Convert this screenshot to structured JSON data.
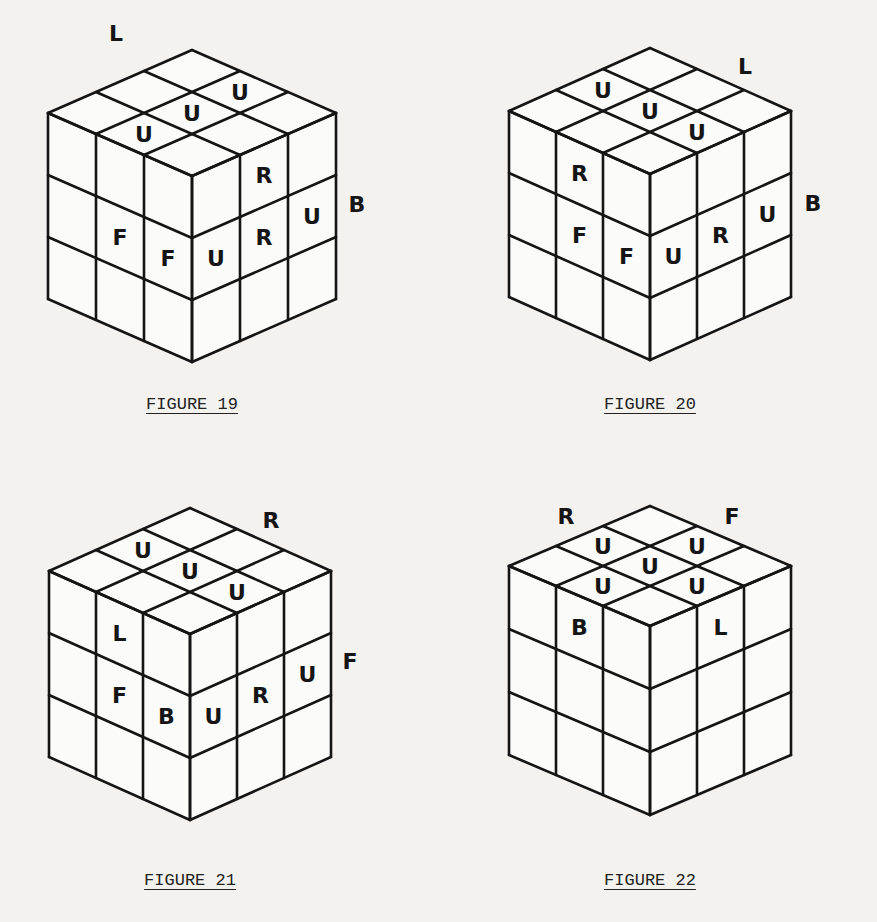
{
  "colors": {
    "background": "#f3f2ef",
    "line": "#151515",
    "face": "#fbfbf9"
  },
  "figures": [
    {
      "caption": "FIGURE 19",
      "origin": [
        0,
        0
      ],
      "cube": {
        "cx": 192,
        "top": 50,
        "dx": 48,
        "dy": 21,
        "h": 62,
        "caption_y": 395
      },
      "face_labels": [
        {
          "text": "L",
          "x": 116,
          "y": 33
        },
        {
          "text": "B",
          "x": 357,
          "y": 204
        }
      ],
      "stickers": [
        {
          "face": "top",
          "row": 0,
          "col": 1,
          "text": "U"
        },
        {
          "face": "top",
          "row": 1,
          "col": 1,
          "text": "U"
        },
        {
          "face": "top",
          "row": 2,
          "col": 1,
          "text": "U"
        },
        {
          "face": "left",
          "row": 1,
          "col": 1,
          "text": "F"
        },
        {
          "face": "left",
          "row": 1,
          "col": 2,
          "text": "F"
        },
        {
          "face": "right",
          "row": 0,
          "col": 1,
          "text": "R"
        },
        {
          "face": "right",
          "row": 1,
          "col": 0,
          "text": "U"
        },
        {
          "face": "right",
          "row": 1,
          "col": 1,
          "text": "R"
        },
        {
          "face": "right",
          "row": 1,
          "col": 2,
          "text": "U"
        }
      ]
    },
    {
      "caption": "FIGURE 20",
      "origin": [
        480,
        0
      ],
      "cube": {
        "cx": 170,
        "top": 48,
        "dx": 47,
        "dy": 21,
        "h": 62,
        "caption_y": 395
      },
      "face_labels": [
        {
          "text": "L",
          "x": 265,
          "y": 66
        },
        {
          "text": "B",
          "x": 333,
          "y": 203
        }
      ],
      "stickers": [
        {
          "face": "top",
          "row": 1,
          "col": 0,
          "text": "U"
        },
        {
          "face": "top",
          "row": 1,
          "col": 1,
          "text": "U"
        },
        {
          "face": "top",
          "row": 1,
          "col": 2,
          "text": "U"
        },
        {
          "face": "left",
          "row": 0,
          "col": 1,
          "text": "R"
        },
        {
          "face": "left",
          "row": 1,
          "col": 1,
          "text": "F"
        },
        {
          "face": "left",
          "row": 1,
          "col": 2,
          "text": "F"
        },
        {
          "face": "right",
          "row": 1,
          "col": 0,
          "text": "U"
        },
        {
          "face": "right",
          "row": 1,
          "col": 1,
          "text": "R"
        },
        {
          "face": "right",
          "row": 1,
          "col": 2,
          "text": "U"
        }
      ]
    },
    {
      "caption": "FIGURE 21",
      "origin": [
        0,
        460
      ],
      "cube": {
        "cx": 190,
        "top": 48,
        "dx": 47,
        "dy": 21,
        "h": 62,
        "caption_y": 411
      },
      "face_labels": [
        {
          "text": "R",
          "x": 271,
          "y": 60
        },
        {
          "text": "F",
          "x": 350,
          "y": 201
        }
      ],
      "stickers": [
        {
          "face": "top",
          "row": 1,
          "col": 0,
          "text": "U"
        },
        {
          "face": "top",
          "row": 1,
          "col": 1,
          "text": "U"
        },
        {
          "face": "top",
          "row": 1,
          "col": 2,
          "text": "U"
        },
        {
          "face": "left",
          "row": 0,
          "col": 1,
          "text": "L"
        },
        {
          "face": "left",
          "row": 1,
          "col": 1,
          "text": "F"
        },
        {
          "face": "left",
          "row": 1,
          "col": 2,
          "text": "B"
        },
        {
          "face": "right",
          "row": 1,
          "col": 0,
          "text": "U"
        },
        {
          "face": "right",
          "row": 1,
          "col": 1,
          "text": "R"
        },
        {
          "face": "right",
          "row": 1,
          "col": 2,
          "text": "U"
        }
      ]
    },
    {
      "caption": "FIGURE 22",
      "origin": [
        480,
        460
      ],
      "cube": {
        "cx": 170,
        "top": 46,
        "dx": 47,
        "dy": 20,
        "h": 63,
        "caption_y": 411
      },
      "face_labels": [
        {
          "text": "R",
          "x": 86,
          "y": 56
        },
        {
          "text": "F",
          "x": 252,
          "y": 56
        }
      ],
      "stickers": [
        {
          "face": "top",
          "row": 0,
          "col": 1,
          "text": "U"
        },
        {
          "face": "top",
          "row": 1,
          "col": 0,
          "text": "U"
        },
        {
          "face": "top",
          "row": 1,
          "col": 1,
          "text": "U"
        },
        {
          "face": "top",
          "row": 1,
          "col": 2,
          "text": "U"
        },
        {
          "face": "top",
          "row": 2,
          "col": 1,
          "text": "U"
        },
        {
          "face": "left",
          "row": 0,
          "col": 1,
          "text": "B"
        },
        {
          "face": "right",
          "row": 0,
          "col": 1,
          "text": "L"
        }
      ]
    }
  ]
}
